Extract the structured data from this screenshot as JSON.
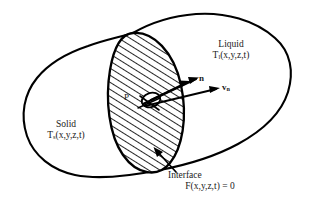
{
  "figure": {
    "background_color": "#ffffff",
    "line_color": "#000000",
    "text_color": "#1a1a1a"
  },
  "regions": {
    "liquid": {
      "name": "Liquid",
      "temperature_symbol": "T",
      "temperature_subscript": "l",
      "temperature_args": "(x,y,z,t)"
    },
    "solid": {
      "name": "Solid",
      "temperature_symbol": "T",
      "temperature_subscript": "s",
      "temperature_args": "(x,y,z,t)"
    }
  },
  "interface": {
    "label": "Interface",
    "equation": "F(x,y,z,t) = 0"
  },
  "vectors": {
    "normal": "n",
    "normal_velocity_symbol": "v",
    "normal_velocity_subscript": "n"
  },
  "point": {
    "label": "P"
  }
}
